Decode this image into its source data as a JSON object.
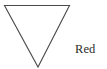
{
  "figure": {
    "background_color": "#ffffff",
    "shape": {
      "name": "inverted-triangle",
      "kind": "triangle",
      "orientation": "pointing-down",
      "stroke_color": "#4a4a4a",
      "stroke_width": 1.1,
      "fill": "none",
      "vertices": [
        {
          "x": 4.5,
          "y": 5.5
        },
        {
          "x": 69.5,
          "y": 5.5
        },
        {
          "x": 38.0,
          "y": 67.0
        }
      ],
      "points_attr": "4.5,5.5 69.5,5.5 38,67"
    },
    "label": {
      "text": "Red",
      "color": "#2b2b2b",
      "font_size_px": 12.5,
      "x": 75,
      "y": 43
    }
  }
}
